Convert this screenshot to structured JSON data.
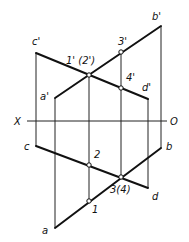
{
  "diagram": {
    "type": "descriptive-geometry-projection",
    "axis": {
      "left_label": "X",
      "right_label": "O"
    },
    "labels": {
      "c_prime": "c'",
      "b_prime": "b'",
      "a_prime": "a'",
      "d_prime": "d'",
      "p12_prime": "1' (2')",
      "p3_prime": "3'",
      "p4_prime": "4'",
      "c": "c",
      "b": "b",
      "d": "d",
      "a": "a",
      "p2": "2",
      "p34": "3(4)",
      "p1": "1"
    }
  }
}
